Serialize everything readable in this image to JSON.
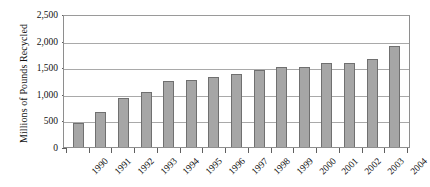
{
  "chart_data": {
    "type": "bar",
    "title": "",
    "xlabel": "",
    "ylabel": "Millions of Pounds Recycled",
    "ylim": [
      0,
      2500
    ],
    "ytick_labels": [
      "0",
      "500",
      "1,000",
      "1,500",
      "2,000",
      "2,500"
    ],
    "ytick_values": [
      0,
      500,
      1000,
      1500,
      2000,
      2500
    ],
    "grid": true,
    "legend": "none",
    "categories": [
      "1990",
      "1991",
      "1992",
      "1993",
      "1994",
      "1995",
      "1996",
      "1997",
      "1998",
      "1999",
      "2000",
      "2001",
      "2002",
      "2003",
      "2004"
    ],
    "values": [
      450,
      650,
      920,
      1030,
      1250,
      1260,
      1320,
      1370,
      1440,
      1500,
      1500,
      1570,
      1580,
      1650,
      1900
    ],
    "bar_color": "#a6a6a6",
    "bar_border_color": "#707070",
    "gridline_color": "#a9a9a9",
    "axis_color": "#8e8e8e",
    "text_color": "#111111",
    "background_color": "#ffffff"
  }
}
